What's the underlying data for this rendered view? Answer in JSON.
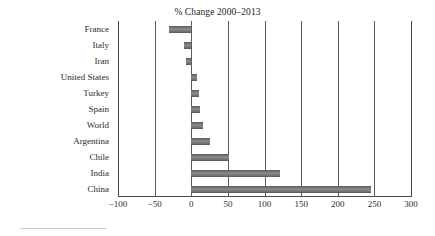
{
  "chart_data": {
    "type": "bar",
    "orientation": "horizontal",
    "title": "% Change 2000–2013",
    "subtitle": "",
    "xlabel": "",
    "ylabel": "",
    "xlim": [
      -100,
      300
    ],
    "ylim": null,
    "grid": true,
    "grid_axis": "x",
    "legend": false,
    "legend_position": "none",
    "bar_color": "#7a7a7a",
    "axis_color": "#4a4a4a",
    "categories": [
      "France",
      "Italy",
      "Iran",
      "United States",
      "Turkey",
      "Spain",
      "World",
      "Argentina",
      "Chile",
      "India",
      "China"
    ],
    "values": [
      -30,
      -10,
      -7,
      8,
      10,
      12,
      16,
      25,
      52,
      121,
      245
    ],
    "xticks": [
      -100,
      -50,
      0,
      50,
      100,
      150,
      200,
      250,
      300
    ],
    "xticklabels": [
      "−100",
      "−50",
      "0",
      "50",
      "100",
      "150",
      "200",
      "250",
      "300"
    ]
  },
  "figure": {
    "background_color": "#ffffff",
    "footer_rule_color": "#c8c8c8"
  }
}
